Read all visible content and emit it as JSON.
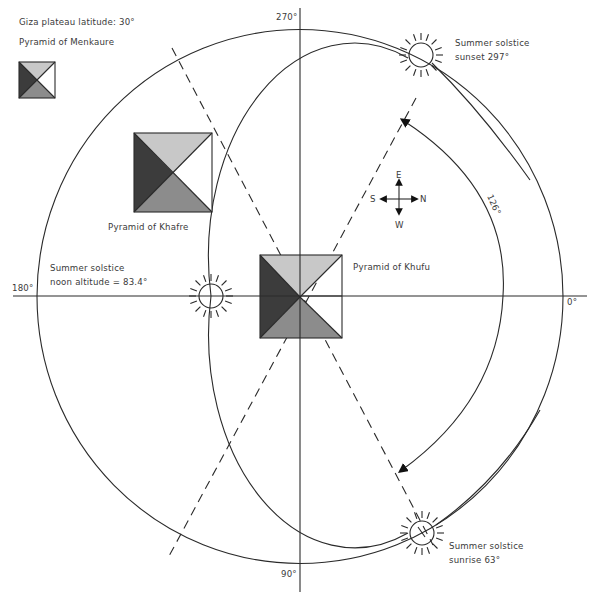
{
  "title": "Giza plateau latitude: 30°",
  "colors": {
    "light_face": "#c8c8c8",
    "dark_face": "#3c3c3c",
    "mid_face": "#8c8c8c",
    "white_face": "#ffffff",
    "stroke": "#2a2a2a",
    "text": "#3a3a3a"
  },
  "compass_degrees": {
    "top": "270°",
    "bottom": "90°",
    "left": "180°",
    "right": "0°"
  },
  "pyramids": [
    {
      "name": "Pyramid of Menkaure"
    },
    {
      "name": "Pyramid of Khafre"
    },
    {
      "name": "Pyramid of Khufu"
    }
  ],
  "suns": {
    "sunset": {
      "line1": "Summer solstice",
      "line2": "sunset 297°"
    },
    "noon": {
      "line1": "Summer solstice",
      "line2": "noon altitude = 83.4°"
    },
    "sunrise": {
      "line1": "Summer solstice",
      "line2": "sunrise 63°"
    }
  },
  "arc_angle": "126°",
  "direction_rose": {
    "up": "E",
    "down": "W",
    "left": "S",
    "right": "N"
  }
}
